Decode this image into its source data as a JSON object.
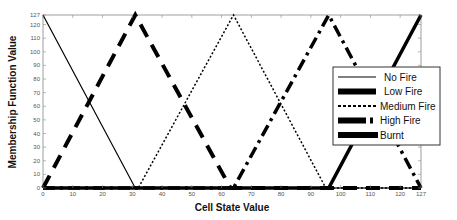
{
  "chart_data": {
    "type": "line",
    "title": "",
    "xlabel": "Cell State Value",
    "ylabel": "Membership Function Value",
    "xlim": [
      0,
      127
    ],
    "ylim": [
      0,
      127
    ],
    "x_ticks": [
      0,
      10,
      20,
      30,
      40,
      50,
      60,
      70,
      80,
      90,
      100,
      110,
      120,
      127
    ],
    "y_ticks": [
      0,
      10,
      20,
      30,
      40,
      50,
      60,
      70,
      80,
      90,
      100,
      110,
      120,
      127
    ],
    "grid": false,
    "legend_position": "right, inside",
    "series": [
      {
        "name": "No Fire",
        "style": "thin solid",
        "x": [
          0,
          31,
          127
        ],
        "y": [
          127,
          0,
          0
        ]
      },
      {
        "name": "Low Fire",
        "style": "thick dashed",
        "x": [
          0,
          31,
          63,
          127
        ],
        "y": [
          0,
          127,
          0,
          0
        ]
      },
      {
        "name": "Medium Fire",
        "style": "dotted",
        "x": [
          0,
          32,
          64,
          95,
          127
        ],
        "y": [
          0,
          0,
          127,
          0,
          0
        ]
      },
      {
        "name": "High Fire",
        "style": "thick dash-dot",
        "x": [
          0,
          64,
          96,
          127
        ],
        "y": [
          0,
          0,
          127,
          0
        ]
      },
      {
        "name": "Burnt",
        "style": "thick solid",
        "x": [
          0,
          96,
          127
        ],
        "y": [
          0,
          0,
          127
        ]
      }
    ]
  }
}
